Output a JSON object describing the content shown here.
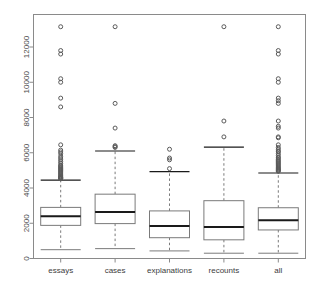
{
  "chart_data": {
    "type": "box",
    "title": "",
    "xlabel": "",
    "ylabel": "",
    "ylim": [
      0,
      13600
    ],
    "grid": false,
    "legend": "none",
    "y_ticks": [
      0,
      2000,
      4000,
      6000,
      8000,
      10000,
      12000
    ],
    "y_tick_labels": [
      "0",
      "2000",
      "4000",
      "6000",
      "8000",
      "10000",
      "12000"
    ],
    "categories": [
      "essays",
      "cases",
      "explanations",
      "recounts",
      "all"
    ],
    "boxes": [
      {
        "name": "essays",
        "whisker_low": 500,
        "q1": 1880,
        "median": 2400,
        "q3": 2900,
        "whisker_high": 4450,
        "outliers": [
          13150,
          11800,
          11600,
          10200,
          10000,
          9100,
          8600,
          6450,
          6150,
          6050,
          5950,
          5800,
          5700,
          5600,
          5500,
          5400,
          5300,
          5250,
          5200,
          5150,
          5100,
          5050,
          5000,
          4950,
          4900,
          4850,
          4800,
          4750,
          4700,
          4650,
          4620,
          4600,
          4580,
          4560,
          4540,
          4520
        ]
      },
      {
        "name": "cases",
        "whisker_low": 560,
        "q1": 1980,
        "median": 2640,
        "q3": 3650,
        "whisker_high": 6100,
        "outliers": [
          13150,
          8800,
          7400,
          6400,
          6350,
          6300
        ]
      },
      {
        "name": "explanations",
        "whisker_low": 430,
        "q1": 1180,
        "median": 1840,
        "q3": 2700,
        "whisker_high": 4930,
        "outliers": [
          6200,
          5700,
          5600,
          5100
        ]
      },
      {
        "name": "recounts",
        "whisker_low": 300,
        "q1": 1060,
        "median": 1790,
        "q3": 3280,
        "whisker_high": 6320,
        "outliers": [
          13150,
          7800,
          6900
        ]
      },
      {
        "name": "all",
        "whisker_low": 300,
        "q1": 1620,
        "median": 2170,
        "q3": 2880,
        "whisker_high": 4850,
        "outliers": [
          13150,
          11800,
          11600,
          10200,
          10000,
          9100,
          8950,
          8800,
          7800,
          7500,
          7400,
          6900,
          6850,
          6450,
          6300,
          6200,
          6100,
          6050,
          5950,
          5850,
          5750,
          5700,
          5620,
          5560,
          5500,
          5440,
          5380,
          5320,
          5260,
          5200,
          5150,
          5100,
          5060,
          5020,
          4980,
          4950
        ]
      }
    ]
  },
  "colors": {
    "frame": "#8a8a8a",
    "box_line": "#7a7a7a",
    "median_line": "#1a1a1a",
    "whisker": "#7a7a7a",
    "outlier": "#5a5a5a",
    "tick_label": "#4a4a4a",
    "background": "#ffffff"
  }
}
